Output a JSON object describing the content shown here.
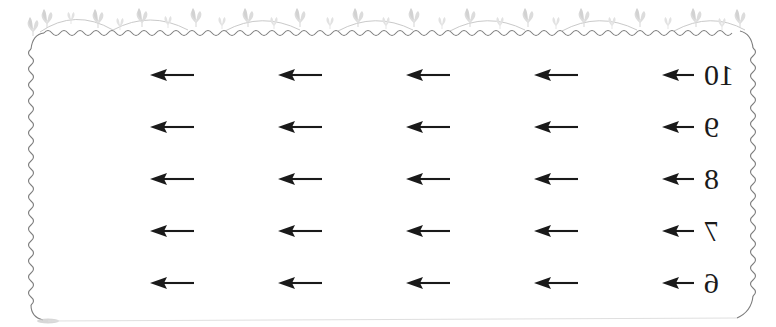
{
  "page": {
    "orientation": "mirrored-horizontal",
    "background_color": "#ffffff",
    "ink_color": "#1a1a1a",
    "border_color": "#8a8a8a",
    "ornament_color": "#d8d8d8",
    "width": 776,
    "height": 327
  },
  "frame": {
    "name": "decorative-wavy-border",
    "top_ornament": "leaf-sprig",
    "top_ornament_count": 22,
    "scallop_count": 7
  },
  "worksheet": {
    "icon": "left-arrow",
    "columns": 5,
    "rows": 5,
    "column_x": [
      148,
      276,
      404,
      532,
      660
    ],
    "row_y": [
      58,
      110,
      162,
      214,
      266
    ],
    "rows_data": [
      {
        "number": "10",
        "arrows": [
          "left-arrow",
          "left-arrow",
          "left-arrow",
          "left-arrow",
          "left-arrow"
        ]
      },
      {
        "number": "9",
        "arrows": [
          "left-arrow",
          "left-arrow",
          "left-arrow",
          "left-arrow",
          "left-arrow"
        ]
      },
      {
        "number": "8",
        "arrows": [
          "left-arrow",
          "left-arrow",
          "left-arrow",
          "left-arrow",
          "left-arrow"
        ]
      },
      {
        "number": "7",
        "arrows": [
          "left-arrow",
          "left-arrow",
          "left-arrow",
          "left-arrow",
          "left-arrow"
        ]
      },
      {
        "number": "6",
        "arrows": [
          "left-arrow",
          "left-arrow",
          "left-arrow",
          "left-arrow",
          "left-arrow"
        ]
      }
    ]
  }
}
